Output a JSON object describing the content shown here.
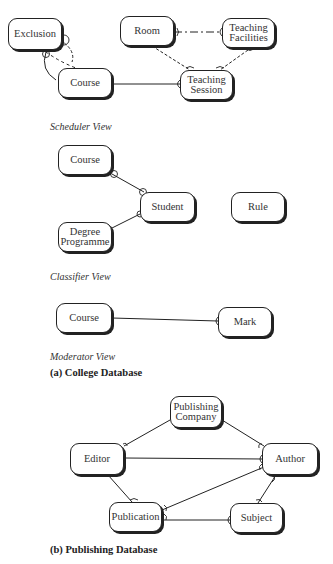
{
  "college": {
    "scheduler": {
      "view_label": "Scheduler View",
      "entities": {
        "exclusion": "Exclusion",
        "course": "Course",
        "room": "Room",
        "teaching_facilities": "Teaching\nFacilities",
        "teaching_session": "Teaching\nSession"
      },
      "relationships": [
        {
          "from": "Exclusion",
          "to": "Course",
          "style": "dashed",
          "note": "recursive/dashed loop"
        },
        {
          "from": "Course",
          "to": "Teaching Session",
          "style": "solid"
        },
        {
          "from": "Room",
          "to": "Teaching Facilities",
          "style": "dashed"
        },
        {
          "from": "Room",
          "to": "Teaching Session",
          "style": "dashed"
        },
        {
          "from": "Teaching Facilities",
          "to": "Teaching Session",
          "style": "dashed"
        }
      ]
    },
    "classifier": {
      "view_label": "Classifier View",
      "entities": {
        "course": "Course",
        "student": "Student",
        "rule": "Rule",
        "degree_programme": "Degree\nProgramme"
      },
      "relationships": [
        {
          "from": "Course",
          "to": "Student",
          "style": "solid"
        },
        {
          "from": "Degree Programme",
          "to": "Student",
          "style": "solid"
        }
      ]
    },
    "moderator": {
      "view_label": "Moderator View",
      "entities": {
        "course": "Course",
        "mark": "Mark"
      },
      "relationships": [
        {
          "from": "Course",
          "to": "Mark",
          "style": "solid"
        }
      ]
    },
    "caption": "(a) College Database"
  },
  "publishing": {
    "entities": {
      "publishing_company": "Publishing\nCompany",
      "editor": "Editor",
      "author": "Author",
      "publication": "Publication",
      "subject": "Subject"
    },
    "relationships": [
      {
        "from": "Publishing Company",
        "to": "Editor",
        "style": "solid"
      },
      {
        "from": "Publishing Company",
        "to": "Author",
        "style": "solid"
      },
      {
        "from": "Editor",
        "to": "Author",
        "style": "solid"
      },
      {
        "from": "Editor",
        "to": "Publication",
        "style": "solid"
      },
      {
        "from": "Publication",
        "to": "Author",
        "style": "solid"
      },
      {
        "from": "Publication",
        "to": "Subject",
        "style": "solid"
      },
      {
        "from": "Author",
        "to": "Subject",
        "style": "solid"
      }
    ],
    "caption": "(b) Publishing Database"
  }
}
